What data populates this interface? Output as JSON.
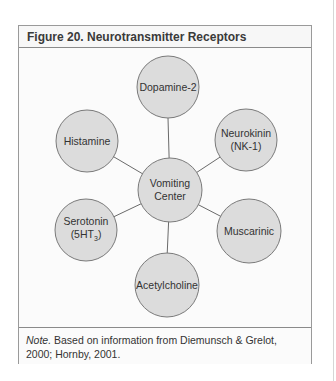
{
  "figure": {
    "title": "Figure 20. Neurotransmitter Receptors",
    "center_node": {
      "line1": "Vomiting",
      "line2": "Center"
    },
    "nodes": [
      {
        "id": "dopamine",
        "line1": "Dopamine-2",
        "line2": ""
      },
      {
        "id": "neurokinin",
        "line1": "Neurokinin",
        "line2": "(NK-1)"
      },
      {
        "id": "muscarinic",
        "line1": "Muscarinic",
        "line2": ""
      },
      {
        "id": "acetylcholine",
        "line1": "Acetylcholine",
        "line2": ""
      },
      {
        "id": "serotonin",
        "line1": "Serotonin",
        "line2_prefix": "(5HT",
        "line2_sub": "3",
        "line2_suffix": ")"
      },
      {
        "id": "histamine",
        "line1": "Histamine",
        "line2": ""
      }
    ],
    "note": {
      "label": "Note.",
      "text": " Based on information from Diemunsch & Grelot, 2000; Hornby, 2001."
    },
    "colors": {
      "circle_fill": "#dcdcdc",
      "circle_stroke": "#7a7a7a",
      "connector": "#6a6a6a",
      "border": "#8a8a8a"
    }
  }
}
